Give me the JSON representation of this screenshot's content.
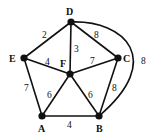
{
  "diagram": {
    "type": "weighted-graph",
    "colors": {
      "stroke": "#111111",
      "background": "#ffffff"
    },
    "nodes": [
      {
        "id": "A",
        "label": "A",
        "x": 42,
        "y": 116,
        "lx": 38,
        "ly": 132
      },
      {
        "id": "B",
        "label": "B",
        "x": 99,
        "y": 116,
        "lx": 96,
        "ly": 132
      },
      {
        "id": "C",
        "label": "C",
        "x": 118,
        "y": 58,
        "lx": 123,
        "ly": 62
      },
      {
        "id": "D",
        "label": "D",
        "x": 71,
        "y": 22,
        "lx": 66,
        "ly": 15
      },
      {
        "id": "E",
        "label": "E",
        "x": 24,
        "y": 58,
        "lx": 9,
        "ly": 62
      },
      {
        "id": "F",
        "label": "F",
        "x": 70,
        "y": 74,
        "lx": 60,
        "ly": 67
      }
    ],
    "edges": [
      {
        "from": "D",
        "to": "E",
        "weight": "2",
        "wx": 42,
        "wy": 38
      },
      {
        "from": "D",
        "to": "F",
        "weight": "3",
        "wx": 74,
        "wy": 52
      },
      {
        "from": "D",
        "to": "C",
        "weight": "8",
        "wx": 94,
        "wy": 38
      },
      {
        "from": "E",
        "to": "F",
        "weight": "4",
        "wx": 45,
        "wy": 65
      },
      {
        "from": "F",
        "to": "C",
        "weight": "7",
        "wx": 90,
        "wy": 64
      },
      {
        "from": "E",
        "to": "A",
        "weight": "7",
        "wx": 24,
        "wy": 91
      },
      {
        "from": "F",
        "to": "A",
        "weight": "6",
        "wx": 47,
        "wy": 98
      },
      {
        "from": "F",
        "to": "B",
        "weight": "6",
        "wx": 88,
        "wy": 98
      },
      {
        "from": "C",
        "to": "B",
        "weight": "8",
        "wx": 112,
        "wy": 91
      },
      {
        "from": "A",
        "to": "B",
        "weight": "4",
        "wx": 67,
        "wy": 128
      },
      {
        "from": "D",
        "to": "B",
        "weight": "8",
        "wx": 141,
        "wy": 64,
        "curved": true
      }
    ]
  }
}
